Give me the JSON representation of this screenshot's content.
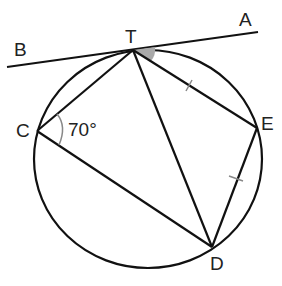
{
  "diagram": {
    "type": "circle-geometry",
    "circle": {
      "cx": 148,
      "cy": 159,
      "rx": 114,
      "ry": 109
    },
    "points": {
      "T": {
        "x": 133,
        "y": 50,
        "label": "T",
        "lx": 125,
        "ly": 43
      },
      "A": {
        "x": 258,
        "y": 32,
        "label": "A",
        "lx": 240,
        "ly": 26
      },
      "B": {
        "x": 7,
        "y": 67,
        "label": "B",
        "lx": 14,
        "ly": 56
      },
      "C": {
        "x": 37,
        "y": 131,
        "label": "C",
        "lx": 17,
        "ly": 136
      },
      "E": {
        "x": 257,
        "y": 128,
        "label": "E",
        "lx": 261,
        "ly": 129
      },
      "D": {
        "x": 212,
        "y": 247,
        "label": "D",
        "lx": 210,
        "ly": 270
      }
    },
    "segments": [
      [
        "B",
        "A"
      ],
      [
        "T",
        "C"
      ],
      [
        "C",
        "D"
      ],
      [
        "T",
        "D"
      ],
      [
        "T",
        "E"
      ],
      [
        "E",
        "D"
      ]
    ],
    "angle_label": "70°",
    "angle_at": "C",
    "shaded_angle_at": "T",
    "equal_marks": [
      "TE",
      "ED"
    ],
    "colors": {
      "line": "#111111",
      "text": "#222222",
      "shade": "#a9a9a9",
      "arc": "#888888"
    }
  }
}
